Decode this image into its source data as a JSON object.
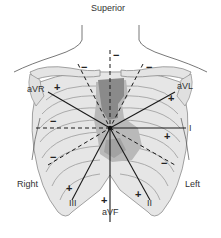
{
  "title": "Superior",
  "orientation": {
    "top": "Superior",
    "right_side": "Right",
    "left_side": "Left"
  },
  "center": {
    "x": 110,
    "y": 128
  },
  "colors": {
    "skeleton_fill": "#e4e4e4",
    "skeleton_stroke": "#8c8c8c",
    "heart_dark": "#8a8a8a",
    "heart_light": "#b9b9b9",
    "axis": "#1a1a1a"
  },
  "leads": [
    {
      "name": "I",
      "angle_deg": 0,
      "positive_end": "left"
    },
    {
      "name": "II",
      "angle_deg": 60,
      "positive_end": "lower-left"
    },
    {
      "name": "III",
      "angle_deg": 120,
      "positive_end": "lower-right"
    },
    {
      "name": "aVR",
      "angle_deg": -150,
      "positive_end": "upper-right"
    },
    {
      "name": "aVL",
      "angle_deg": -30,
      "positive_end": "upper-left"
    },
    {
      "name": "aVF",
      "angle_deg": 90,
      "positive_end": "inferior"
    }
  ],
  "labels": {
    "superior": "Superior",
    "right": "Right",
    "left": "Left",
    "aVR": "aVR",
    "aVL": "aVL",
    "I": "I",
    "II": "II",
    "III": "III",
    "aVF": "aVF"
  },
  "signs": {
    "plus": "+",
    "minus": "−"
  }
}
